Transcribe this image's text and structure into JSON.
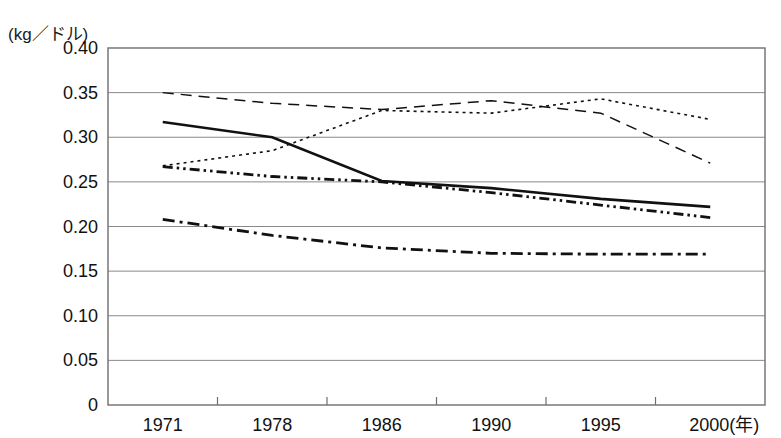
{
  "chart_data": {
    "type": "line",
    "title": "",
    "unit_label": "(kg／ドル)",
    "xlabel": "(年)",
    "ylabel": "",
    "categories": [
      "1971",
      "1978",
      "1986",
      "1990",
      "1995",
      "2000"
    ],
    "x_axis_suffix": "(年)",
    "ylim": [
      0,
      0.4
    ],
    "ytick_labels": [
      "0.40",
      "0.35",
      "0.30",
      "0.25",
      "0.20",
      "0.15",
      "0.10",
      "0.05",
      "0"
    ],
    "ytick_values": [
      0.4,
      0.35,
      0.3,
      0.25,
      0.2,
      0.15,
      0.1,
      0.05,
      0
    ],
    "grid": true,
    "legend": "none",
    "series": [
      {
        "name": "series-solid",
        "style": "solid",
        "dash": "none",
        "width": 2.6,
        "color": "#111111",
        "values": [
          0.317,
          0.3,
          0.251,
          0.243,
          0.231,
          0.222
        ]
      },
      {
        "name": "series-long-dash",
        "style": "dashed",
        "dash": "11,7",
        "width": 1.5,
        "color": "#111111",
        "values": [
          0.35,
          0.338,
          0.331,
          0.341,
          0.327,
          0.271
        ]
      },
      {
        "name": "series-fine-dot",
        "style": "dotted",
        "dash": "3,4",
        "width": 1.6,
        "color": "#111111",
        "values": [
          0.268,
          0.285,
          0.33,
          0.327,
          0.343,
          0.32
        ]
      },
      {
        "name": "series-dash-dot-dot",
        "style": "dash-dot-dot",
        "dash": "10,4,2.5,4,2.5,4",
        "width": 2.8,
        "color": "#111111",
        "values": [
          0.267,
          0.256,
          0.25,
          0.238,
          0.224,
          0.21
        ]
      },
      {
        "name": "series-dash-dot",
        "style": "dash-dot",
        "dash": "12,5,3,5",
        "width": 2.8,
        "color": "#111111",
        "values": [
          0.208,
          0.19,
          0.176,
          0.17,
          0.169,
          0.169
        ]
      }
    ]
  },
  "colors": {
    "grid": "#8a8a8a",
    "frame": "#6e6e6e",
    "ink": "#111111",
    "background": "#ffffff"
  }
}
